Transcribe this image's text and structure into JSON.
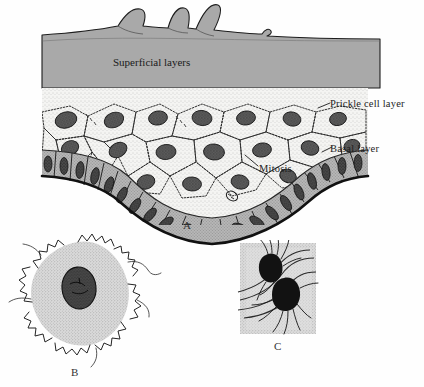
{
  "figure": {
    "background_color": "#fefefe"
  },
  "panel_a": {
    "letter": "A",
    "labels": {
      "superficial": "Superficial layers",
      "prickle": "Prickle cell layer",
      "basal": "Basal layer",
      "mitosis": "Mitosis"
    },
    "colors": {
      "superficial_fill": "#a9a9a9",
      "prickle_fill": "#f2f2f0",
      "basal_fill": "#b4b4b4",
      "nucleus_fill": "#5a5a5a",
      "outline": "#161616"
    }
  },
  "panel_b": {
    "letter": "B",
    "description": "Isolated prickle cell with desmosome spines",
    "colors": {
      "cytoplasm_fill": "#dcdcdc",
      "nucleus_fill": "#4e4e4e",
      "spine_stroke": "#2b2b2b"
    }
  },
  "panel_c": {
    "letter": "C",
    "description": "Desmosome with tonofilaments",
    "colors": {
      "background_fill": "#d8d8d8",
      "plaque_fill": "#121212",
      "membrane_stroke": "#2a2a2a"
    }
  }
}
